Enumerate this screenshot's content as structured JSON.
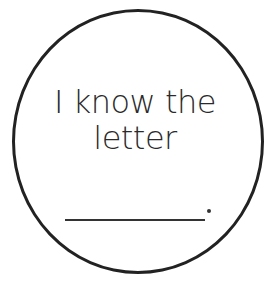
{
  "badge": {
    "shape": "circle",
    "border_color": "#222222",
    "text_lines": [
      "I know the",
      "letter"
    ],
    "blank": {
      "type": "fill-in-line",
      "trailing_punctuation": "."
    }
  }
}
